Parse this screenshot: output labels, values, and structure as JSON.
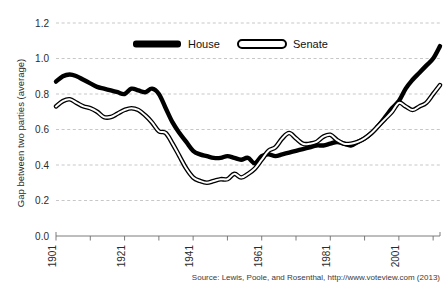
{
  "chart_data": {
    "type": "line",
    "title": "",
    "xlabel": "",
    "ylabel": "Gap between two parties (average)",
    "ylim": [
      0.0,
      1.2
    ],
    "xlim": [
      1901,
      2013
    ],
    "grid": true,
    "legend_position": "top-center",
    "ytick_labels": [
      "0.0",
      "0.2",
      "0.4",
      "0.6",
      "0.8",
      "1.0",
      "1.2"
    ],
    "ytick_values": [
      0.0,
      0.2,
      0.4,
      0.6,
      0.8,
      1.0,
      1.2
    ],
    "xtick_labels": [
      "1901",
      "1921",
      "1941",
      "1961",
      "1981",
      "2001"
    ],
    "xtick_values": [
      1901,
      1921,
      1941,
      1961,
      1981,
      2001
    ],
    "xtick_minor_values": [
      1911,
      1931,
      1951,
      1971,
      1991,
      2011
    ],
    "source": "Source: Lewis, Poole, and Rosenthal, http://www.voteview.com (2013)",
    "x": [
      1901,
      1903,
      1905,
      1907,
      1909,
      1911,
      1913,
      1915,
      1917,
      1919,
      1921,
      1923,
      1925,
      1927,
      1929,
      1931,
      1933,
      1935,
      1937,
      1939,
      1941,
      1943,
      1945,
      1947,
      1949,
      1951,
      1953,
      1955,
      1957,
      1959,
      1961,
      1963,
      1965,
      1967,
      1969,
      1971,
      1973,
      1975,
      1977,
      1979,
      1981,
      1983,
      1985,
      1987,
      1989,
      1991,
      1993,
      1995,
      1997,
      1999,
      2001,
      2003,
      2005,
      2007,
      2009,
      2011,
      2013
    ],
    "series": [
      {
        "name": "House",
        "style": "solid-black",
        "color": "#000000",
        "values": [
          0.87,
          0.9,
          0.91,
          0.9,
          0.88,
          0.86,
          0.84,
          0.83,
          0.82,
          0.81,
          0.8,
          0.83,
          0.82,
          0.81,
          0.83,
          0.8,
          0.72,
          0.64,
          0.58,
          0.53,
          0.48,
          0.46,
          0.45,
          0.44,
          0.44,
          0.45,
          0.44,
          0.43,
          0.44,
          0.41,
          0.45,
          0.46,
          0.45,
          0.46,
          0.47,
          0.48,
          0.49,
          0.5,
          0.51,
          0.51,
          0.52,
          0.53,
          0.52,
          0.51,
          0.53,
          0.55,
          0.58,
          0.62,
          0.67,
          0.72,
          0.76,
          0.83,
          0.88,
          0.92,
          0.96,
          1.0,
          1.07
        ]
      },
      {
        "name": "Senate",
        "style": "hollow-outline",
        "color": "#ffffff",
        "outline": "#000000",
        "values": [
          0.73,
          0.76,
          0.77,
          0.75,
          0.73,
          0.72,
          0.7,
          0.67,
          0.67,
          0.69,
          0.71,
          0.72,
          0.71,
          0.68,
          0.64,
          0.59,
          0.58,
          0.52,
          0.45,
          0.38,
          0.33,
          0.31,
          0.3,
          0.31,
          0.32,
          0.32,
          0.35,
          0.33,
          0.35,
          0.38,
          0.43,
          0.48,
          0.5,
          0.55,
          0.58,
          0.55,
          0.52,
          0.52,
          0.53,
          0.56,
          0.57,
          0.54,
          0.52,
          0.52,
          0.53,
          0.55,
          0.58,
          0.62,
          0.66,
          0.7,
          0.75,
          0.73,
          0.71,
          0.73,
          0.75,
          0.8,
          0.85
        ]
      }
    ]
  },
  "legend": {
    "items": [
      {
        "label": "House"
      },
      {
        "label": "Senate"
      }
    ]
  },
  "colors": {
    "house_line": "#000000",
    "senate_fill": "#ffffff",
    "senate_outline": "#000000",
    "gridline": "#b9b9b9",
    "axis": "#6d6d6d",
    "text": "#2b2b2b",
    "background": "#ffffff"
  }
}
